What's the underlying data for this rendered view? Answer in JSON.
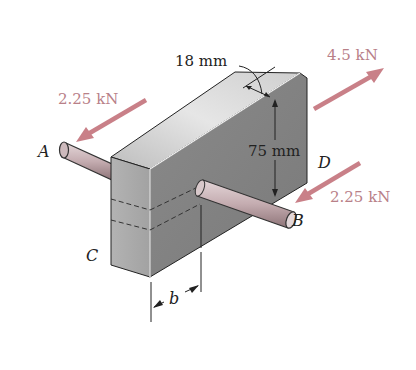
{
  "figure": {
    "block": {
      "thickness_label": "18 mm",
      "height_label": "75 mm",
      "width_dimension_label": "b"
    },
    "points": {
      "A": "A",
      "B": "B",
      "C": "C",
      "D": "D"
    },
    "forces": {
      "force_A": {
        "label": "2.25 kN",
        "direction": "toward lower-left"
      },
      "force_B": {
        "label": "2.25 kN",
        "direction": "toward lower-left"
      },
      "force_D": {
        "label": "4.5 kN",
        "direction": "toward upper-right"
      }
    },
    "colors": {
      "force_arrow": "#c98088",
      "force_label": "#b88088",
      "block_end_face": "#a9a9a9",
      "block_top_face": "#d4d4d4",
      "block_side_face": "#8e8e8e",
      "pin": "#c9b4b8",
      "ink": "#222222"
    }
  }
}
